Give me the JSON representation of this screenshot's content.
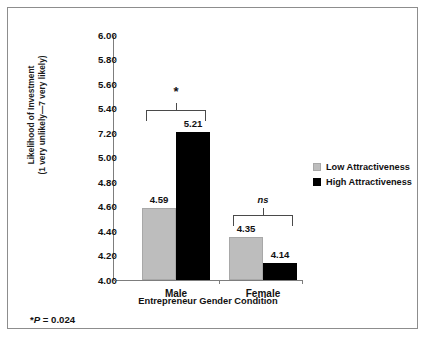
{
  "chart_data": {
    "type": "bar",
    "title": "",
    "xlabel": "Entrepreneur Gender Condition",
    "ylabel_line1": "Likelihood of Investment",
    "ylabel_line2": "(1 very unlikely—7 very likely)",
    "categories": [
      "Male",
      "Female"
    ],
    "series": [
      {
        "name": "Low Attractiveness",
        "color": "#bdbdbd",
        "values": [
          4.59,
          4.35
        ]
      },
      {
        "name": "High Attractiveness",
        "color": "#000000",
        "values": [
          5.21,
          4.14
        ]
      }
    ],
    "ylim": [
      4.0,
      6.0
    ],
    "ytick_labels": [
      "6.00",
      "5.80",
      "5.60",
      "5.40",
      "7.20",
      "5.00",
      "4.80",
      "4.60",
      "4.40",
      "4.20",
      "4.00"
    ],
    "ytick_positions": [
      6.0,
      5.8,
      5.6,
      5.4,
      5.2,
      5.0,
      4.8,
      4.6,
      4.4,
      4.2,
      4.0
    ],
    "grid": false,
    "legend_position": "right",
    "annotations": [
      {
        "group": "Male",
        "label": "*",
        "style": "star"
      },
      {
        "group": "Female",
        "label": "ns",
        "style": "ns"
      }
    ],
    "value_labels": [
      "4.59",
      "5.21",
      "4.35",
      "4.14"
    ]
  },
  "axis": {
    "y_title_line1": "Likelihood of Investment",
    "y_title_line2": "(1 very unlikely—7 very likely)",
    "x_title": "Entrepreneur Gender Condition",
    "ticks": [
      {
        "label": "6.00"
      },
      {
        "label": "5.80"
      },
      {
        "label": "5.60"
      },
      {
        "label": "5.40"
      },
      {
        "label": "7.20"
      },
      {
        "label": "5.00"
      },
      {
        "label": "4.80"
      },
      {
        "label": "4.60"
      },
      {
        "label": "4.40"
      },
      {
        "label": "4.20"
      },
      {
        "label": "4.00"
      }
    ]
  },
  "groups": [
    {
      "name": "Male",
      "sig_label": "*",
      "bars": [
        {
          "series": "Low Attractiveness",
          "value_label": "4.59"
        },
        {
          "series": "High Attractiveness",
          "value_label": "5.21"
        }
      ]
    },
    {
      "name": "Female",
      "sig_label": "ns",
      "bars": [
        {
          "series": "Low Attractiveness",
          "value_label": "4.35"
        },
        {
          "series": "High Attractiveness",
          "value_label": "4.14"
        }
      ]
    }
  ],
  "legend": {
    "items": [
      {
        "label": "Low Attractiveness",
        "color": "#bdbdbd"
      },
      {
        "label": "High Attractiveness",
        "color": "#000000"
      }
    ]
  },
  "footnote": {
    "star": "*",
    "p_italic": "P",
    "p_value": " = 0.024"
  }
}
